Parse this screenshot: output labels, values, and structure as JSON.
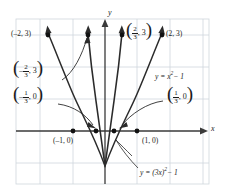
{
  "figure": {
    "type": "graph"
  },
  "axes": {
    "x_label": "x",
    "y_label": "y",
    "grid": true,
    "xlim": [
      -2.6,
      2.6
    ],
    "ylim": [
      -1.6,
      3.9
    ],
    "grid_color": "#cfd6dd",
    "axis_color": "#3a3a3a"
  },
  "curves": [
    {
      "name": "wide-parabola",
      "equation_label": "y = x",
      "equation_exponent": "2",
      "equation_tail": " − 1",
      "formula": "y = x^2 - 1",
      "color": "#2b2b2b"
    },
    {
      "name": "narrow-parabola",
      "equation_label": "y = (3x)",
      "equation_exponent": "2",
      "equation_tail": " − 1",
      "formula": "y = (3x)^2 - 1",
      "color": "#2b2b2b"
    }
  ],
  "points": [
    {
      "id": "p-neg2-3",
      "label": "(–2, 3)",
      "x": -2,
      "y": 3
    },
    {
      "id": "p-2-3",
      "label": "(2, 3)",
      "x": 2,
      "y": 3
    },
    {
      "id": "p-neg1-0",
      "label": "(–1, 0)",
      "x": -1,
      "y": 0
    },
    {
      "id": "p-1-0",
      "label": "(1, 0)",
      "x": 1,
      "y": 0
    },
    {
      "id": "p-neg23-3",
      "numer": "2",
      "denom": "3",
      "sign": "–",
      "tail": ", 3",
      "x": -0.667,
      "y": 3
    },
    {
      "id": "p-23-3",
      "numer": "2",
      "denom": "3",
      "sign": "",
      "tail": ", 3",
      "x": 0.667,
      "y": 3
    },
    {
      "id": "p-neg13-0",
      "numer": "1",
      "denom": "3",
      "sign": "–",
      "tail": ", 0",
      "x": -0.333,
      "y": 0
    },
    {
      "id": "p-13-0",
      "numer": "1",
      "denom": "3",
      "sign": "",
      "tail": ", 0",
      "x": 0.333,
      "y": 0
    }
  ],
  "labels": {
    "neg2_3": "(–2, 3)",
    "pos2_3": "(2, 3)",
    "neg1_0": "(–1, 0)",
    "pos1_0": "(1, 0)",
    "eq_wide_head": "y = x",
    "eq_wide_sup": "2",
    "eq_wide_tail": "− 1",
    "eq_narrow_head": "y = (3x)",
    "eq_narrow_sup": "2",
    "eq_narrow_tail": "− 1",
    "frac_num_2": "2",
    "frac_den_3": "3",
    "frac_num_1": "1",
    "minus": "–",
    "comma_3": ", 3",
    "comma_0": ", 0",
    "lparen": "(",
    "rparen": ")",
    "x_axis": "x",
    "y_axis": "y"
  }
}
